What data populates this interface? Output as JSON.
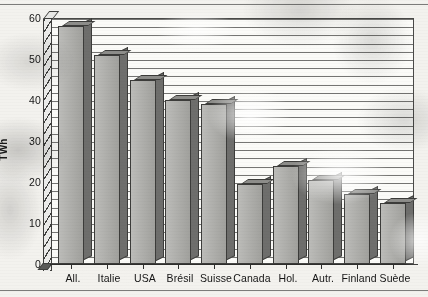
{
  "chart_data": {
    "type": "bar",
    "title": "",
    "xlabel": "",
    "ylabel": "TWh",
    "ylim": [
      0,
      60
    ],
    "ytick_step": 10,
    "yticks": [
      0,
      10,
      20,
      30,
      40,
      50,
      60
    ],
    "grid": true,
    "grid_orientation": "horizontal",
    "grid_minor_step": 2,
    "legend": null,
    "categories": [
      "All.",
      "Italie",
      "USA",
      "Brésil",
      "Suisse",
      "Canada",
      "Hol.",
      "Autr.",
      "Finland",
      "Suède"
    ],
    "values": [
      58,
      51,
      45,
      40,
      39,
      19.5,
      24,
      20.5,
      17,
      15
    ],
    "series": [
      {
        "name": "TWh",
        "values": [
          58,
          51,
          45,
          40,
          39,
          19.5,
          24,
          20.5,
          17,
          15
        ]
      }
    ],
    "style": "3d-extruded-bars",
    "colors": {
      "bar_front": "#a9a9a5",
      "bar_side": "#6e6e6c",
      "bar_top": "#c9c9c5",
      "outline": "#3c3c3a",
      "gridline": "#5d5d5b",
      "plot_background": "#fbfbf8",
      "page_background": "#f3f2ee",
      "text": "#141414"
    }
  },
  "axis": {
    "y_title": "TWh",
    "y_tick_labels": [
      "60",
      "50",
      "40",
      "30",
      "20",
      "10",
      "0"
    ],
    "x_tick_labels": [
      "All.",
      "Italie",
      "USA",
      "Brésil",
      "Suisse",
      "Canada",
      "Hol.",
      "Autr.",
      "Finland",
      "Suède"
    ]
  }
}
